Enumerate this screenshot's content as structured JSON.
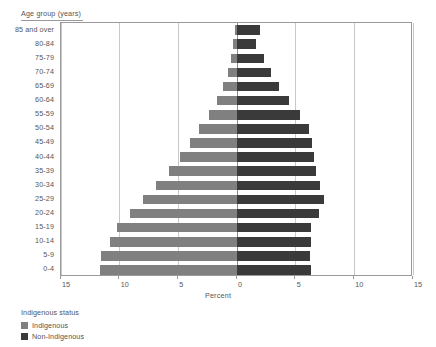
{
  "chart_data": {
    "type": "bar",
    "subtype": "population-pyramid",
    "title": "",
    "xlabel": "Percent",
    "ylabel": "Age group (years)",
    "xlim": [
      -15,
      15
    ],
    "xticks": [
      15,
      10,
      5,
      0,
      5,
      10,
      15
    ],
    "grid": true,
    "orientation": "horizontal",
    "legend_position": "bottom-left",
    "legend_title": "Indigenous status",
    "categories": [
      "85 and over",
      "80-84",
      "75-79",
      "70-74",
      "65-69",
      "60-64",
      "55-59",
      "50-54",
      "45-49",
      "40-44",
      "35-39",
      "30-34",
      "25-29",
      "20-24",
      "15-19",
      "10-14",
      "5-9",
      "0-4"
    ],
    "series": [
      {
        "name": "Indigenous",
        "side": "left",
        "color": "#808080",
        "values": [
          0.2,
          0.3,
          0.5,
          0.8,
          1.2,
          1.7,
          2.4,
          3.2,
          4.0,
          4.9,
          5.8,
          6.9,
          8.0,
          9.1,
          10.2,
          10.8,
          11.6,
          11.7
        ]
      },
      {
        "name": "Non-Indigenous",
        "side": "right",
        "color": "#3a3a3a",
        "values": [
          2.0,
          1.6,
          2.3,
          2.9,
          3.6,
          4.4,
          5.4,
          6.1,
          6.4,
          6.6,
          6.7,
          7.1,
          7.4,
          7.0,
          6.3,
          6.3,
          6.2,
          6.3
        ]
      }
    ]
  },
  "axis": {
    "y_title": "Age group (years)",
    "x_title": "Percent",
    "x_tick_labels": [
      "15",
      "10",
      "5",
      "0",
      "5",
      "10",
      "15"
    ]
  },
  "legend": {
    "title": "Indigenous status",
    "items": [
      {
        "label": "Indigenous",
        "color": "#808080"
      },
      {
        "label": "Non-Indigenous",
        "color": "#3a3a3a"
      }
    ]
  }
}
